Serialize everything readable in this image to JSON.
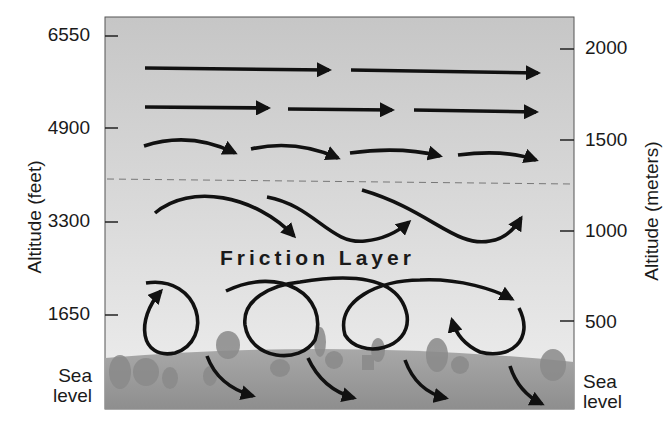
{
  "diagram": {
    "title_label": "Friction Layer",
    "left_axis": {
      "title": "Altitude (feet)",
      "ticks": [
        {
          "label": "6550",
          "y": 36
        },
        {
          "label": "4900",
          "y": 128
        },
        {
          "label": "3300",
          "y": 222
        },
        {
          "label": "1650",
          "y": 315
        }
      ],
      "base_label_line1": "Sea",
      "base_label_line2": "level"
    },
    "right_axis": {
      "title": "Altitude (meters)",
      "ticks": [
        {
          "label": "2000",
          "y": 49
        },
        {
          "label": "1500",
          "y": 140
        },
        {
          "label": "1000",
          "y": 231
        },
        {
          "label": "500",
          "y": 321
        }
      ],
      "base_label_line1": "Sea",
      "base_label_line2": "level"
    },
    "regions": {
      "upper": "laminar flow above friction layer (straight arrows)",
      "boundary": "dashed line marking top of friction layer",
      "lower": "turbulent eddies near surface"
    },
    "colors": {
      "sky_top": "#c9c9c9",
      "sky_bottom": "#ececec",
      "ground": "#9a9a9a",
      "arrow": "#111111",
      "frame": "#555555"
    }
  }
}
